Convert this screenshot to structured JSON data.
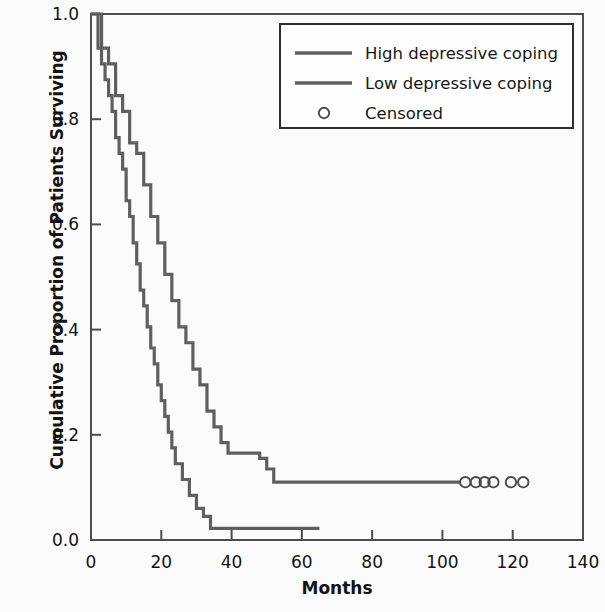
{
  "chart_data": {
    "type": "line",
    "subtype": "kaplan-meier-step",
    "title": "",
    "xlabel": "Months",
    "ylabel": "Cumulative Proportion of Patients Surviving",
    "xlim": [
      0,
      140
    ],
    "ylim": [
      0.0,
      1.0
    ],
    "xticks": [
      0,
      20,
      40,
      60,
      80,
      100,
      120,
      140
    ],
    "xtick_labels": [
      "0",
      "20",
      "40",
      "60",
      "80",
      "100",
      "120",
      "140"
    ],
    "yticks": [
      0.0,
      0.2,
      0.4,
      0.6,
      0.8,
      1.0
    ],
    "ytick_labels": [
      "0.0",
      "0.2",
      "0.4",
      "0.6",
      "0.8",
      "1.0"
    ],
    "grid": false,
    "legend_position": "top-right",
    "series": [
      {
        "name": "High depressive coping",
        "style": "step",
        "color": "#5f5f5f",
        "x": [
          0,
          2,
          3,
          4,
          5,
          6,
          7,
          8,
          9,
          10,
          11,
          12,
          13,
          14,
          15,
          16,
          17,
          18,
          19,
          20,
          21,
          22,
          23,
          24,
          26,
          28,
          30,
          32,
          34,
          65
        ],
        "y": [
          1.0,
          0.935,
          0.905,
          0.875,
          0.845,
          0.815,
          0.765,
          0.735,
          0.705,
          0.645,
          0.615,
          0.565,
          0.525,
          0.475,
          0.445,
          0.405,
          0.365,
          0.335,
          0.295,
          0.265,
          0.235,
          0.205,
          0.175,
          0.145,
          0.115,
          0.085,
          0.06,
          0.045,
          0.022,
          0.022
        ]
      },
      {
        "name": "Low depressive coping",
        "style": "step",
        "color": "#5f5f5f",
        "x": [
          0,
          3,
          5,
          7,
          9,
          11,
          13,
          15,
          17,
          19,
          21,
          23,
          25,
          27,
          29,
          31,
          33,
          35,
          37,
          39,
          41,
          44,
          48,
          50,
          52,
          105
        ],
        "y": [
          1.0,
          0.935,
          0.905,
          0.845,
          0.815,
          0.755,
          0.735,
          0.675,
          0.615,
          0.565,
          0.505,
          0.455,
          0.405,
          0.375,
          0.325,
          0.295,
          0.245,
          0.215,
          0.185,
          0.165,
          0.165,
          0.165,
          0.155,
          0.135,
          0.11,
          0.11
        ]
      }
    ],
    "censored": {
      "name": "Censored",
      "marker": "open-circle",
      "color": "#4a4a4a",
      "points": [
        {
          "x": 106.5,
          "y": 0.11
        },
        {
          "x": 109.5,
          "y": 0.11
        },
        {
          "x": 112.0,
          "y": 0.11
        },
        {
          "x": 114.5,
          "y": 0.11
        },
        {
          "x": 119.5,
          "y": 0.11
        },
        {
          "x": 123.0,
          "y": 0.11
        }
      ]
    },
    "legend": [
      {
        "label": "High depressive coping",
        "marker": "line",
        "color": "#5f5f5f"
      },
      {
        "label": "Low depressive coping",
        "marker": "line",
        "color": "#5f5f5f"
      },
      {
        "label": "Censored",
        "marker": "open-circle",
        "color": "#4a4a4a"
      }
    ],
    "colors": {
      "axis": "#4d4d4d",
      "text": "#121212",
      "background": "#fbfbfb",
      "plot_background": "#fbfbfb",
      "legend_background": "#fefefe"
    }
  }
}
